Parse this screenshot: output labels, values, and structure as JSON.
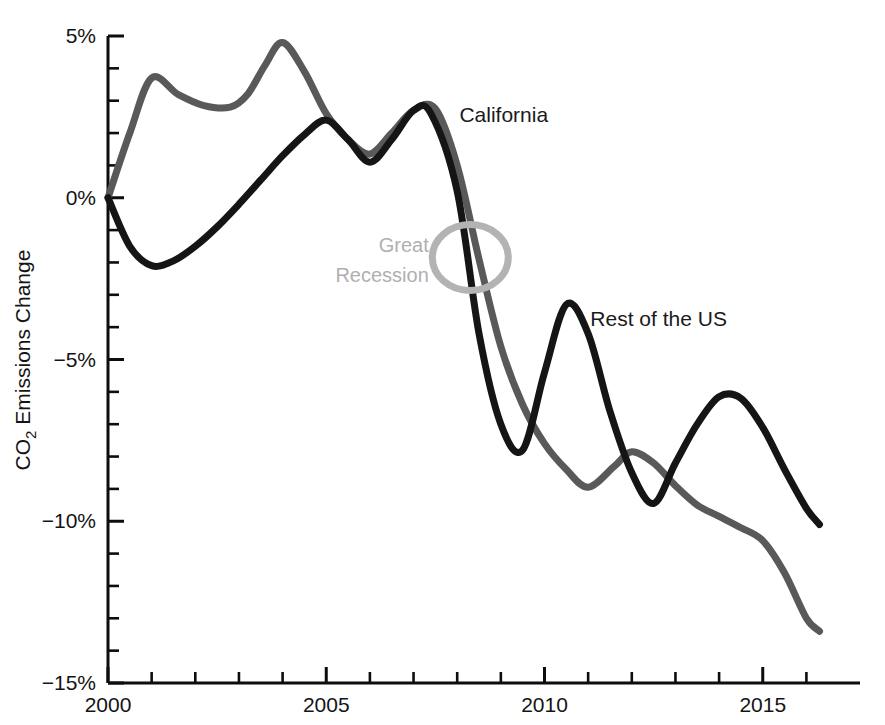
{
  "chart_data": {
    "type": "line",
    "title": "",
    "subtitle": "",
    "xlabel": "",
    "ylabel": "CO2 Emissions Change",
    "ylabel_main": "CO",
    "ylabel_sub": "2",
    "ylabel_rest": " Emissions Change",
    "xlim": [
      2000,
      2016.3
    ],
    "ylim": [
      -15,
      5
    ],
    "grid": false,
    "legend_position": "inline-annotations",
    "x_tick_labels": [
      "2000",
      "2005",
      "2010",
      "2015"
    ],
    "x_tick_values": [
      2000,
      2005,
      2010,
      2015
    ],
    "x_minor_tick_values": [
      2001,
      2002,
      2003,
      2004,
      2006,
      2007,
      2008,
      2009,
      2011,
      2012,
      2013,
      2014,
      2016
    ],
    "y_tick_labels": [
      "5%",
      "0%",
      "−5%",
      "−10%",
      "−15%"
    ],
    "y_tick_values": [
      5,
      0,
      -5,
      -10,
      -15
    ],
    "y_minor_tick_values": [
      4,
      3,
      2,
      1,
      -1,
      -2,
      -3,
      -4,
      -6,
      -7,
      -8,
      -9,
      -11,
      -12,
      -13,
      -14
    ],
    "series": [
      {
        "name": "California",
        "color": "#595959",
        "label_x": 2008.05,
        "label_y": 2.55,
        "x": [
          2000,
          2000.5,
          2001,
          2001.6,
          2002.2,
          2002.8,
          2003.2,
          2003.6,
          2004,
          2004.5,
          2005,
          2005.5,
          2006,
          2006.5,
          2007,
          2007.5,
          2008,
          2008.5,
          2009,
          2009.5,
          2010,
          2010.5,
          2011,
          2011.6,
          2012,
          2012.5,
          2013,
          2013.5,
          2014,
          2014.5,
          2015,
          2015.5,
          2016,
          2016.3
        ],
        "y": [
          0.0,
          2.0,
          3.7,
          3.2,
          2.85,
          2.8,
          3.2,
          4.1,
          4.8,
          3.9,
          2.6,
          1.8,
          1.35,
          2.0,
          2.7,
          2.75,
          1.0,
          -1.9,
          -4.6,
          -6.4,
          -7.6,
          -8.4,
          -8.95,
          -8.3,
          -7.85,
          -8.2,
          -8.9,
          -9.5,
          -9.85,
          -10.2,
          -10.6,
          -11.6,
          -13.0,
          -13.4
        ]
      },
      {
        "name": "Rest of the US",
        "color": "#151515",
        "label_x": 2011.05,
        "label_y": -3.75,
        "x": [
          2000,
          2000.5,
          2001,
          2001.5,
          2002,
          2002.5,
          2003,
          2003.5,
          2004,
          2004.5,
          2005,
          2005.5,
          2006,
          2006.5,
          2007,
          2007.4,
          2008,
          2008.5,
          2009,
          2009.5,
          2010,
          2010.5,
          2011,
          2011.5,
          2012,
          2012.5,
          2013,
          2013.5,
          2014,
          2014.5,
          2015,
          2015.5,
          2016,
          2016.3
        ],
        "y": [
          0.0,
          -1.5,
          -2.1,
          -1.95,
          -1.5,
          -0.9,
          -0.2,
          0.55,
          1.3,
          1.95,
          2.4,
          1.8,
          1.1,
          1.8,
          2.7,
          2.6,
          0.2,
          -4.2,
          -7.0,
          -7.8,
          -5.4,
          -3.3,
          -4.2,
          -6.6,
          -8.5,
          -9.45,
          -8.2,
          -7.0,
          -6.15,
          -6.2,
          -7.1,
          -8.4,
          -9.6,
          -10.1
        ]
      }
    ],
    "annotations": [
      {
        "name": "great-recession",
        "text_line1": "Great",
        "text_line2": "Recession",
        "color": "#b3b3b3",
        "text_x": 2007.35,
        "text_y1": -1.45,
        "text_y2": -2.4,
        "ellipse_cx": 2008.3,
        "ellipse_cy": -1.85,
        "ellipse_rx_years": 0.87,
        "ellipse_ry_pct": 1.02
      }
    ]
  },
  "geometry": {
    "plot_left": 108,
    "plot_right": 856,
    "plot_top": 36,
    "plot_bottom": 683
  }
}
